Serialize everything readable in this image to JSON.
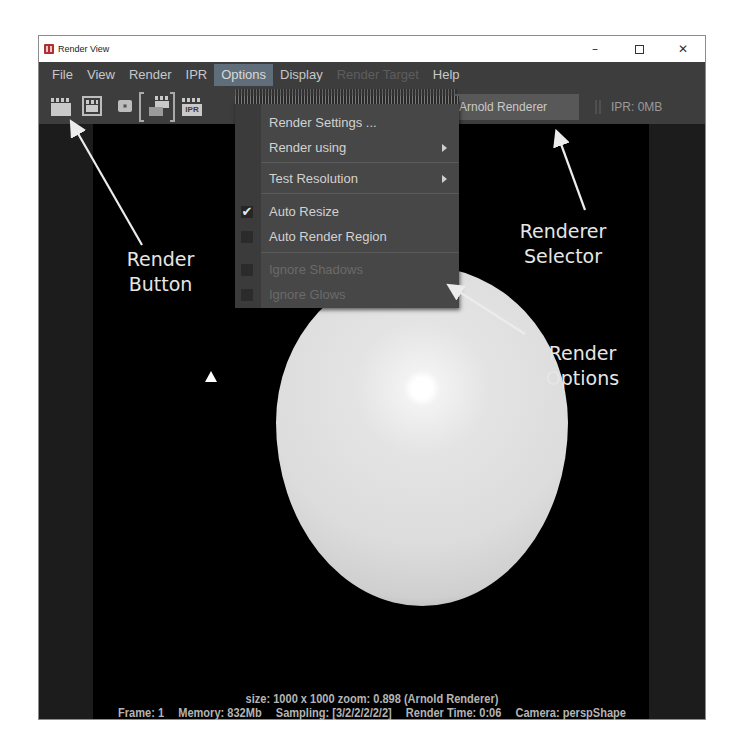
{
  "window": {
    "title": "Render View",
    "controls": {
      "minimize": "–",
      "maximize": "",
      "close": "✕"
    }
  },
  "menubar": {
    "items": [
      {
        "label": "File",
        "state": "normal"
      },
      {
        "label": "View",
        "state": "normal"
      },
      {
        "label": "Render",
        "state": "normal"
      },
      {
        "label": "IPR",
        "state": "normal"
      },
      {
        "label": "Options",
        "state": "active"
      },
      {
        "label": "Display",
        "state": "normal"
      },
      {
        "label": "Render Target",
        "state": "disabled"
      },
      {
        "label": "Help",
        "state": "normal"
      }
    ]
  },
  "toolbar": {
    "icons": [
      {
        "name": "render-frame-icon"
      },
      {
        "name": "render-region-icon"
      },
      {
        "name": "snapshot-icon"
      },
      {
        "name": "render-sequence-icon"
      },
      {
        "name": "ipr-render-icon",
        "label": "IPR"
      }
    ],
    "renderer": "Arnold Renderer",
    "ipr_memory": "IPR: 0MB"
  },
  "options_menu": {
    "items": [
      {
        "label": "Render Settings ...",
        "submenu": false,
        "checkbox": null,
        "enabled": true
      },
      {
        "label": "Render using",
        "submenu": true,
        "checkbox": null,
        "enabled": true
      },
      {
        "label": "Test Resolution",
        "submenu": true,
        "checkbox": null,
        "enabled": true
      },
      {
        "label": "Auto Resize",
        "submenu": false,
        "checkbox": true,
        "enabled": true
      },
      {
        "label": "Auto Render Region",
        "submenu": false,
        "checkbox": false,
        "enabled": true
      },
      {
        "label": "Ignore Shadows",
        "submenu": false,
        "checkbox": false,
        "enabled": false
      },
      {
        "label": "Ignore Glows",
        "submenu": false,
        "checkbox": false,
        "enabled": false
      }
    ],
    "check_glyph": "✔"
  },
  "status": {
    "line1": "size: 1000 x 1000  zoom: 0.898     (Arnold Renderer)",
    "frame": "Frame: 1",
    "memory": "Memory: 832Mb",
    "sampling": "Sampling: [3/2/2/2/2/2]",
    "render_time": "Render Time: 0:06",
    "camera": "Camera: perspShape"
  },
  "annotations": {
    "render_button": [
      "Render",
      "Button"
    ],
    "renderer_selector": [
      "Renderer",
      "Selector"
    ],
    "render_options": [
      "Render",
      "Options"
    ]
  },
  "colors": {
    "window_bg": "#3d3d3d",
    "active_menu": "#5f6e7a",
    "canvas": "#000000",
    "menu_bg": "#474747",
    "text": "#c8c8c8"
  }
}
